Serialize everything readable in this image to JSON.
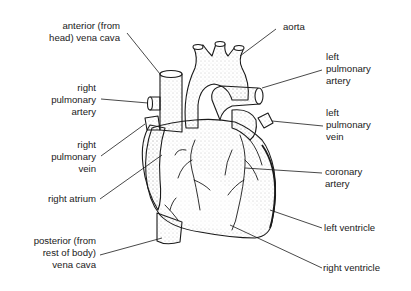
{
  "labels": {
    "anterior_vena_cava": "anterior (from\nhead) vena cava",
    "right_pulmonary_artery": "right\npulmonary\nartery",
    "right_pulmonary_vein": "right\npulmonary\nvein",
    "right_atrium": "right atrium",
    "posterior_vena_cava": "posterior (from\nrest of body)\nvena cava",
    "aorta": "aorta",
    "left_pulmonary_artery": "left\npulmonary\nartery",
    "left_pulmonary_vein": "left\npulmonary\nvein",
    "coronary_artery": "coronary\nartery",
    "left_ventricle": "left ventricle",
    "right_ventricle": "right ventricle"
  },
  "colors": {
    "ink": "#1a1a1a",
    "stipple": "#9a9a9a",
    "background": "#ffffff"
  }
}
